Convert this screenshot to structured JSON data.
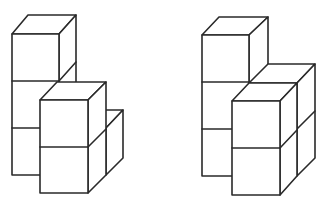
{
  "figures": [
    {
      "name": "left-cube-structure",
      "description": "Isometric stack of unit cubes: a 3-high back column, a 2-high front column, and a 2-high column at back right",
      "cube_count_visible": 7
    },
    {
      "name": "right-cube-structure",
      "description": "Isometric stack of unit cubes: a 3-high back column with a 2x2x2-style block in front and to the right",
      "cube_count_visible": 7
    }
  ],
  "colors": {
    "line": "#2a2a2a",
    "background": "#ffffff"
  }
}
